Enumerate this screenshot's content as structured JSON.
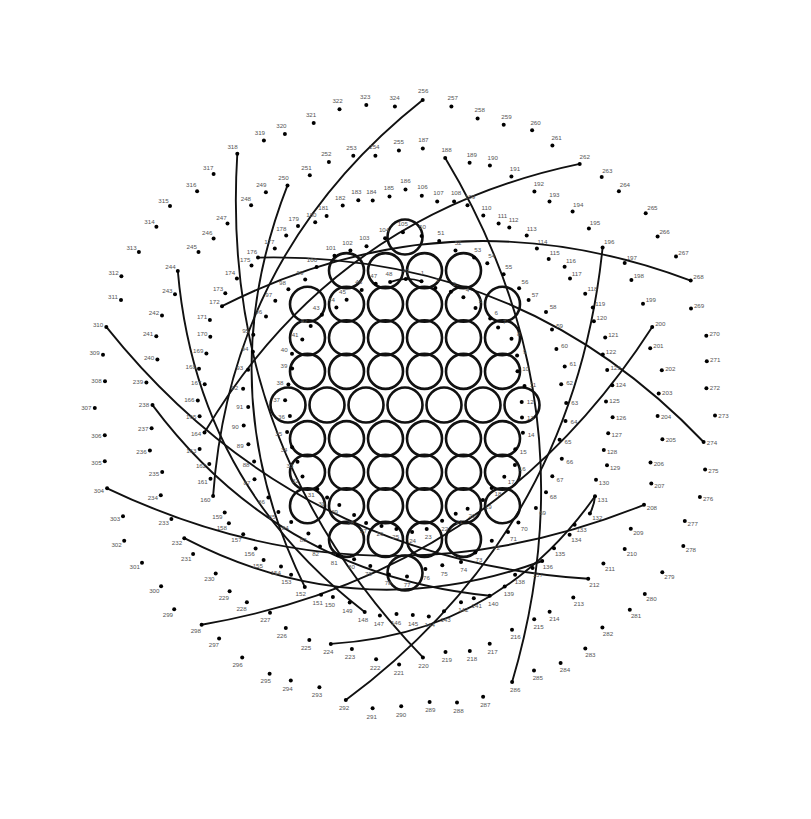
{
  "page": {
    "kind": "dot-to-dot-mandala",
    "width": 811,
    "height": 819,
    "background_color": "#ffffff",
    "dot_color": "#000000",
    "label_color": "#555555",
    "stroke_color": "#111111",
    "dot_count": 324,
    "number_range": "1-324"
  },
  "center_motif": {
    "name": "hexagonal-circle-grid",
    "circle_count": 61,
    "circle_radius": 17.5,
    "stroke_width": 2.6,
    "center_x": 405,
    "center_y": 405,
    "row_lengths": [
      1,
      4,
      6,
      6,
      6,
      7,
      6,
      6,
      6,
      4,
      1
    ],
    "description": "Hexagonally packed open circles forming a flower core"
  },
  "rings": [
    {
      "name": "ring-1",
      "from": 1,
      "to": 49,
      "radius_x": 118,
      "radius_y": 122,
      "label": "Inner ring 1-49"
    },
    {
      "name": "ring-2",
      "from": 50,
      "to": 105,
      "radius_x": 160,
      "radius_y": 164,
      "label": "Second ring 50-105"
    },
    {
      "name": "ring-3",
      "from": 106,
      "to": 186,
      "radius_x": 205,
      "radius_y": 206,
      "label": "Third ring 106-186"
    },
    {
      "name": "ring-4",
      "from": 187,
      "to": 255,
      "radius_x": 255,
      "radius_y": 250,
      "label": "Fourth ring 187-255"
    },
    {
      "name": "ring-5",
      "from": 256,
      "to": 324,
      "radius_x": 305,
      "radius_y": 297,
      "label": "Outer ring 256-324"
    }
  ],
  "arcs": [
    {
      "name": "arc-48-1",
      "from": 48,
      "to": 1,
      "bow": 0.18
    },
    {
      "name": "arc-232-136",
      "from": 232,
      "to": 136,
      "bow": 0.22
    },
    {
      "name": "arc-238-140",
      "from": 238,
      "to": 140,
      "bow": 0.22
    },
    {
      "name": "arc-244-148",
      "from": 244,
      "to": 148,
      "bow": 0.22
    },
    {
      "name": "arc-250-152",
      "from": 250,
      "to": 152,
      "bow": 0.22
    },
    {
      "name": "arc-224-131",
      "from": 224,
      "to": 131,
      "bow": 0.24
    },
    {
      "name": "arc-132-131",
      "from": 132,
      "to": 131,
      "bow": 0.1
    },
    {
      "name": "arc-256-160",
      "from": 256,
      "to": 160,
      "bow": 0.22
    },
    {
      "name": "arc-164-262",
      "from": 164,
      "to": 262,
      "bow": 0.22
    },
    {
      "name": "arc-318-220",
      "from": 318,
      "to": 220,
      "bow": 0.22
    },
    {
      "name": "arc-310-212",
      "from": 310,
      "to": 212,
      "bow": 0.22
    },
    {
      "name": "arc-208-304",
      "from": 208,
      "to": 304,
      "bow": 0.22
    },
    {
      "name": "arc-268-172",
      "from": 268,
      "to": 172,
      "bow": 0.22
    },
    {
      "name": "arc-176-274",
      "from": 176,
      "to": 274,
      "bow": 0.22
    },
    {
      "name": "arc-298-200",
      "from": 298,
      "to": 200,
      "bow": 0.22
    },
    {
      "name": "arc-196-292",
      "from": 196,
      "to": 292,
      "bow": 0.22
    },
    {
      "name": "arc-188-286",
      "from": 188,
      "to": 286,
      "bow": 0.22
    }
  ],
  "numbers": [
    1,
    2,
    3,
    4,
    5,
    6,
    7,
    8,
    9,
    10,
    11,
    12,
    13,
    14,
    15,
    16,
    17,
    18,
    19,
    20,
    21,
    22,
    23,
    24,
    25,
    26,
    27,
    28,
    29,
    30,
    31,
    32,
    33,
    34,
    35,
    36,
    37,
    38,
    39,
    40,
    41,
    42,
    43,
    44,
    45,
    46,
    47,
    48,
    49,
    50,
    51,
    52,
    53,
    54,
    55,
    56,
    57,
    58,
    59,
    60,
    61,
    62,
    63,
    64,
    65,
    66,
    67,
    68,
    69,
    70,
    71,
    72,
    73,
    74,
    75,
    76,
    77,
    78,
    79,
    80,
    81,
    82,
    83,
    84,
    85,
    86,
    87,
    88,
    89,
    90,
    91,
    92,
    93,
    94,
    95,
    96,
    97,
    98,
    99,
    100,
    101,
    102,
    103,
    104,
    105,
    106,
    107,
    108,
    109,
    110,
    111,
    112,
    113,
    114,
    115,
    116,
    117,
    118,
    119,
    120,
    121,
    122,
    123,
    124,
    125,
    126,
    127,
    128,
    129,
    130,
    131,
    132,
    133,
    134,
    135,
    136,
    137,
    138,
    139,
    140,
    141,
    142,
    143,
    144,
    145,
    146,
    147,
    148,
    149,
    150,
    151,
    152,
    153,
    154,
    155,
    156,
    157,
    158,
    159,
    160,
    161,
    162,
    163,
    164,
    165,
    166,
    167,
    168,
    169,
    170,
    171,
    172,
    173,
    174,
    175,
    176,
    177,
    178,
    179,
    180,
    181,
    182,
    183,
    184,
    185,
    186,
    187,
    188,
    189,
    190,
    191,
    192,
    193,
    194,
    195,
    196,
    197,
    198,
    199,
    200,
    201,
    202,
    203,
    204,
    205,
    206,
    207,
    208,
    209,
    210,
    211,
    212,
    213,
    214,
    215,
    216,
    217,
    218,
    219,
    220,
    221,
    222,
    223,
    224,
    225,
    226,
    227,
    228,
    229,
    230,
    231,
    232,
    233,
    234,
    235,
    236,
    237,
    238,
    239,
    240,
    241,
    242,
    243,
    244,
    245,
    246,
    247,
    248,
    249,
    250,
    251,
    252,
    253,
    254,
    255,
    256,
    257,
    258,
    259,
    260,
    261,
    262,
    263,
    264,
    265,
    266,
    267,
    268,
    269,
    270,
    271,
    272,
    273,
    274,
    275,
    276,
    277,
    278,
    279,
    280,
    281,
    282,
    283,
    284,
    285,
    286,
    287,
    288,
    289,
    290,
    291,
    292,
    293,
    294,
    295,
    296,
    297,
    298,
    299,
    300,
    301,
    302,
    303,
    304,
    305,
    306,
    307,
    308,
    309,
    310,
    311,
    312,
    313,
    314,
    315,
    316,
    317,
    318,
    319,
    320,
    321,
    322,
    323,
    324
  ]
}
